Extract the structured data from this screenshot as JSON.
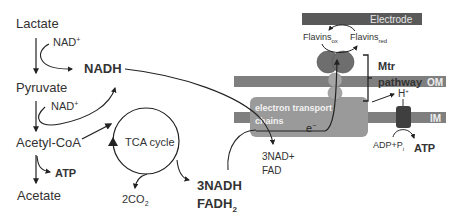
{
  "metabolites": {
    "lactate": "Lactate",
    "pyruvate": "Pyruvate",
    "acetyl_coa": "Acetyl-CoA",
    "acetate": "Acetate"
  },
  "cofactors": {
    "nad_plus_1": "NAD",
    "nad_plus_2": "NAD",
    "plus_sup": "+",
    "nadh": "NADH",
    "atp_left": "ATP",
    "co2": "2CO",
    "co2_sub": "2",
    "nadh3": "3NADH",
    "fadh2": "FADH",
    "fadh2_sub": "2",
    "nad3": "3NAD+",
    "fad": "FAD"
  },
  "tca": {
    "label": "TCA cycle"
  },
  "membrane": {
    "electrode": "Electrode",
    "om": "OM",
    "im": "IM",
    "flavins_ox": "Flavins",
    "flavins_ox_sub": "ox",
    "flavins_red": "Flavins",
    "flavins_red_sub": "red",
    "mtr_line1": "Mtr",
    "mtr_line2": "pathway",
    "etc_line1": "electron transport",
    "etc_line2": "chains",
    "electron": "e",
    "electron_sup": "−",
    "proton": "H",
    "proton_sup": "+",
    "adp": "ADP+P",
    "adp_sub": "i",
    "atp_right": "ATP"
  },
  "colors": {
    "electrode": "#595959",
    "om_bar": "#7f7f7f",
    "im_bar": "#7f7f7f",
    "etc_box": "#9a9a9a",
    "big_protein": "#6e6e6e",
    "small_protein": "#a6a6a6",
    "atp_synthase": "#3f3f3f",
    "line": "#222222"
  }
}
